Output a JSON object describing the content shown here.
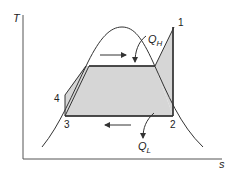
{
  "diagram": {
    "type": "T-s diagram (refrigeration cycle)",
    "axes": {
      "y_label": "T",
      "x_label": "s"
    },
    "points": [
      {
        "label": "1",
        "x": 174,
        "y": 27
      },
      {
        "label": "2",
        "x": 173,
        "y": 116
      },
      {
        "label": "3",
        "x": 65,
        "y": 116
      },
      {
        "label": "4",
        "x": 65,
        "y": 95
      }
    ],
    "heat_labels": {
      "q_high": {
        "main": "Q",
        "sub": "H"
      },
      "q_low": {
        "main": "Q",
        "sub": "L"
      }
    },
    "colors": {
      "line": "#333333",
      "fill": "#d6d6d6",
      "axis": "#555555",
      "background": "#ffffff"
    }
  }
}
